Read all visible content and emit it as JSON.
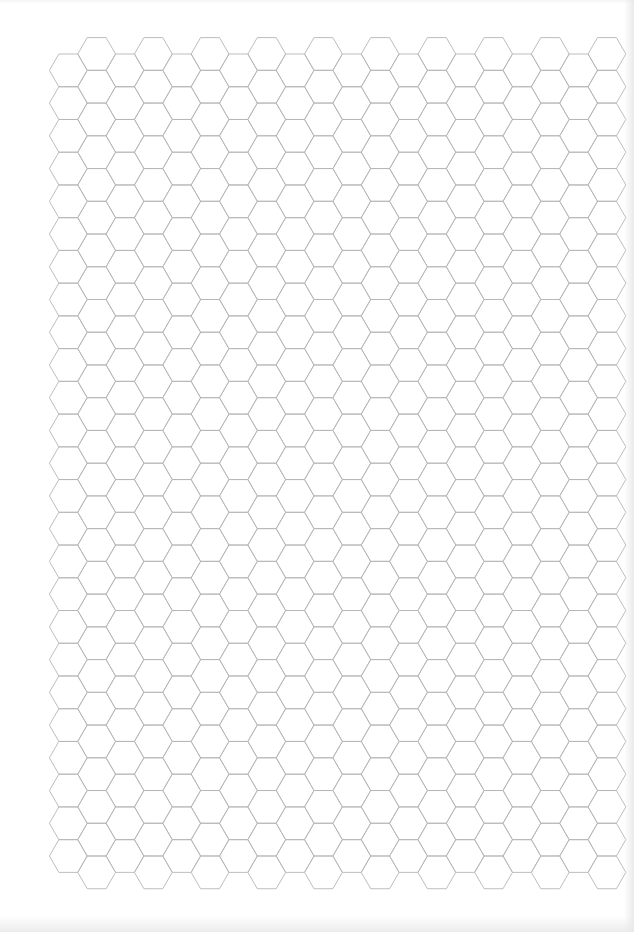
{
  "page": {
    "width": 634,
    "height": 932,
    "background": "#ffffff"
  },
  "hex_grid": {
    "orientation": "flat-top",
    "side": 18.9,
    "columns": 20,
    "first_column_center_x": 68.3,
    "column_step": 28.35,
    "down_column_top_y": 54.0,
    "up_column_top_y": 37.6,
    "rows_in_down_columns": 25,
    "rows_in_up_columns": 26,
    "up_columns": "odd",
    "stroke_color": "#b5b5b5",
    "stroke_width": 0.9
  }
}
